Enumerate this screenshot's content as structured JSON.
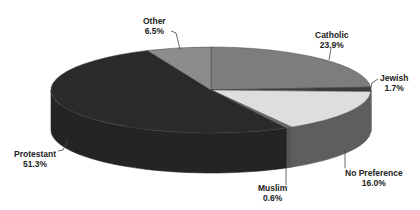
{
  "chart_data": {
    "type": "pie",
    "style": "3d",
    "title": "",
    "slices": [
      {
        "label": "Catholic",
        "value": 23.9,
        "display": "23.9%",
        "color": "#7d7d7d",
        "side": "#6a6a6a"
      },
      {
        "label": "Jewish",
        "value": 1.7,
        "display": "1.7%",
        "color": "#3c3c3c",
        "side": "#333333"
      },
      {
        "label": "No Preference",
        "value": 16.0,
        "display": "16.0%",
        "color": "#dedede",
        "side": "#5e5e5e"
      },
      {
        "label": "Muslim",
        "value": 0.6,
        "display": "0.6%",
        "color": "#6e6e6e",
        "side": "#555555"
      },
      {
        "label": "Protestant",
        "value": 51.3,
        "display": "51.3%",
        "color": "#2a2a2a",
        "side": "#242424"
      },
      {
        "label": "Other",
        "value": 6.5,
        "display": "6.5%",
        "color": "#8c8c8c",
        "side": "#777777"
      }
    ],
    "start_angle_deg": 0,
    "direction": "clockwise",
    "legend": "none (callout labels)"
  },
  "labels": {
    "catholic": {
      "name": "Catholic",
      "pct": "23.9%"
    },
    "jewish": {
      "name": "Jewish",
      "pct": "1.7%"
    },
    "no_preference": {
      "name": "No Preference",
      "pct": "16.0%"
    },
    "muslim": {
      "name": "Muslim",
      "pct": "0.6%"
    },
    "protestant": {
      "name": "Protestant",
      "pct": "51.3%"
    },
    "other": {
      "name": "Other",
      "pct": "6.5%"
    }
  }
}
